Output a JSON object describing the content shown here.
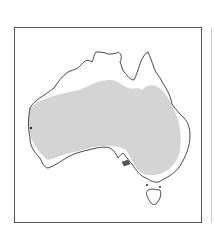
{
  "map": {
    "subject": "Australia",
    "shaded_region": "interior range (shaded area)",
    "colors": {
      "background": "#ffffff",
      "coastline": "#333333",
      "shaded": "#d4d4d4",
      "frame": "#555555"
    }
  }
}
